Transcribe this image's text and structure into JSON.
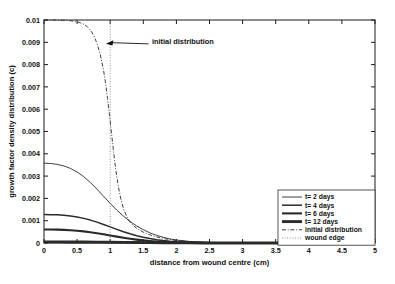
{
  "chart_data": {
    "type": "line",
    "title": "",
    "xlabel": "distance from wound centre (cm)",
    "ylabel": "growth factor density distribution (c)",
    "xlim": [
      0,
      5
    ],
    "ylim": [
      0,
      0.01
    ],
    "grid": false,
    "legend_position": "lower right",
    "xticks": [
      "0",
      "0.5",
      "1",
      "1.5",
      "2",
      "2.5",
      "3",
      "3.5",
      "4",
      "4.5",
      "5"
    ],
    "xtick_values": [
      0,
      0.5,
      1,
      1.5,
      2,
      2.5,
      3,
      3.5,
      4,
      4.5,
      5
    ],
    "yticks": [
      "0",
      "0.001",
      "0.002",
      "0.003",
      "0.004",
      "0.005",
      "0.006",
      "0.007",
      "0.008",
      "0.009",
      "0.01"
    ],
    "ytick_values": [
      0,
      0.001,
      0.002,
      0.003,
      0.004,
      0.005,
      0.006,
      0.007,
      0.008,
      0.009,
      0.01
    ],
    "annotations": [
      {
        "text": "initial distribution",
        "text_x": 1.63,
        "text_y": 0.00905,
        "arrow_tip_x": 0.935,
        "arrow_tip_y": 0.00893,
        "arrow_tail_x": 1.58,
        "arrow_tail_y": 0.00893
      }
    ],
    "series": [
      {
        "name": "t= 2 days",
        "style": "solid",
        "width": 0.9,
        "color": "#2a2a2a",
        "x": [
          0,
          0.1,
          0.2,
          0.3,
          0.4,
          0.5,
          0.6,
          0.7,
          0.8,
          0.9,
          1.0,
          1.1,
          1.2,
          1.3,
          1.4,
          1.5,
          1.6,
          1.7,
          1.8,
          1.9,
          2.0,
          2.2,
          2.4,
          2.6,
          2.8,
          3.0,
          3.5,
          4.0,
          4.5,
          5.0
        ],
        "values": [
          0.00358,
          0.003565,
          0.003525,
          0.003455,
          0.003345,
          0.003185,
          0.002975,
          0.002715,
          0.002415,
          0.002095,
          0.001775,
          0.001475,
          0.001205,
          0.000965,
          0.000765,
          0.000595,
          0.000455,
          0.000345,
          0.000255,
          0.000185,
          0.000135,
          7e-05,
          3.5e-05,
          1.8e-05,
          1e-05,
          6e-06,
          2e-06,
          1e-06,
          5e-07,
          3e-07
        ]
      },
      {
        "name": "t= 4 days",
        "style": "solid",
        "width": 1.5,
        "color": "#2a2a2a",
        "x": [
          0,
          0.1,
          0.2,
          0.3,
          0.4,
          0.5,
          0.6,
          0.7,
          0.8,
          0.9,
          1.0,
          1.1,
          1.2,
          1.3,
          1.4,
          1.5,
          1.6,
          1.7,
          1.8,
          1.9,
          2.0,
          2.2,
          2.4,
          2.6,
          2.8,
          3.0,
          3.5,
          4.0,
          4.5,
          5.0
        ],
        "values": [
          0.001275,
          0.001272,
          0.001262,
          0.001243,
          0.001212,
          0.001167,
          0.001105,
          0.001027,
          0.000935,
          0.000832,
          0.000722,
          0.000612,
          0.000507,
          0.000412,
          0.000328,
          0.000256,
          0.000197,
          0.000149,
          0.000111,
          8.1e-05,
          5.8e-05,
          3e-05,
          1.5e-05,
          7e-06,
          4e-06,
          2e-06,
          1e-06,
          5e-07,
          2e-07,
          1e-07
        ]
      },
      {
        "name": "t= 6 days",
        "style": "solid",
        "width": 2.1,
        "color": "#2a2a2a",
        "x": [
          0,
          0.1,
          0.2,
          0.3,
          0.4,
          0.5,
          0.6,
          0.7,
          0.8,
          0.9,
          1.0,
          1.1,
          1.2,
          1.3,
          1.4,
          1.5,
          1.6,
          1.7,
          1.8,
          1.9,
          2.0,
          2.2,
          2.4,
          2.6,
          2.8,
          3.0,
          3.5,
          4.0,
          4.5,
          5.0
        ],
        "values": [
          0.000605,
          0.000603,
          0.000598,
          0.000588,
          0.000573,
          0.000551,
          0.000521,
          0.000484,
          0.00044,
          0.000391,
          0.000339,
          0.000287,
          0.000237,
          0.000192,
          0.000152,
          0.000118,
          9e-05,
          6.8e-05,
          5e-05,
          3.6e-05,
          2.6e-05,
          1.3e-05,
          6e-06,
          3e-06,
          1.5e-06,
          8e-07,
          3e-07,
          1e-07,
          5e-08,
          2e-08
        ]
      },
      {
        "name": "t= 12 days",
        "style": "solid",
        "width": 2.9,
        "color": "#2a2a2a",
        "x": [
          0,
          0.2,
          0.4,
          0.6,
          0.8,
          1.0,
          1.2,
          1.4,
          1.6,
          1.8,
          2.0,
          2.2,
          2.4,
          2.6,
          2.8,
          3.0,
          3.5,
          4.0,
          4.5,
          5.0
        ],
        "values": [
          5e-05,
          4.95e-05,
          4.7e-05,
          4.35e-05,
          3.85e-05,
          3.25e-05,
          2.62e-05,
          2.02e-05,
          1.49e-05,
          1.06e-05,
          7.2e-06,
          4.7e-06,
          3e-06,
          1.8e-06,
          1e-06,
          6e-07,
          2e-07,
          1e-07,
          5e-08,
          2e-08
        ]
      },
      {
        "name": "initial distribution",
        "style": "dashdot",
        "width": 0.9,
        "color": "#2a2a2a",
        "x": [
          0,
          0.1,
          0.2,
          0.3,
          0.4,
          0.5,
          0.55,
          0.6,
          0.65,
          0.7,
          0.75,
          0.8,
          0.85,
          0.9,
          0.93,
          0.96,
          0.99,
          1.02,
          1.05,
          1.08,
          1.12,
          1.16,
          1.2,
          1.25,
          1.3,
          1.35,
          1.4,
          1.5,
          1.6,
          1.7,
          1.8,
          1.9,
          2.0,
          2.2,
          2.5,
          3.0,
          3.5,
          4.0,
          4.5,
          5.0
        ],
        "values": [
          0.01,
          0.01,
          0.009995,
          0.009985,
          0.009965,
          0.009915,
          0.009875,
          0.00981,
          0.00971,
          0.00955,
          0.00932,
          0.00895,
          0.00845,
          0.00774,
          0.00716,
          0.00648,
          0.00573,
          0.00492,
          0.00412,
          0.00338,
          0.00258,
          0.00198,
          0.00155,
          0.00118,
          0.00094,
          0.00078,
          0.00066,
          0.000485,
          0.000365,
          0.000275,
          0.000205,
          0.000152,
          0.000112,
          6e-05,
          2.4e-05,
          6e-06,
          1.5e-06,
          5e-07,
          2e-07,
          1e-07
        ]
      },
      {
        "name": "wound edge",
        "style": "dotted",
        "width": 0.8,
        "color": "#6a6a6a",
        "x": [
          1.0,
          1.0
        ],
        "values": [
          0,
          0.01
        ]
      }
    ]
  },
  "legend": {
    "entries": [
      {
        "label": "t= 2 days",
        "style": "solid",
        "width": 0.9
      },
      {
        "label": "t= 4 days",
        "style": "solid",
        "width": 1.5
      },
      {
        "label": "t= 6 days",
        "style": "solid",
        "width": 2.1
      },
      {
        "label": "t= 12 days",
        "style": "solid",
        "width": 2.9
      },
      {
        "label": "initial distribution",
        "style": "dashdot",
        "width": 0.9
      },
      {
        "label": "wound edge",
        "style": "dotted",
        "width": 0.8
      }
    ]
  },
  "colors": {
    "background": "#ffffff",
    "axis": "#1a1a1a",
    "curve": "#2a2a2a",
    "wound_edge": "#6a6a6a",
    "text": "#111111"
  }
}
